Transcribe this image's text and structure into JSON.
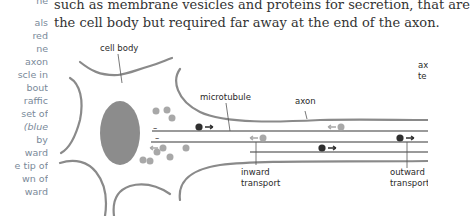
{
  "body_text": {
    "line1": "such as membrane vesicles and proteins for secretion, that are",
    "line2": "the cell body but required far away at the end of the axon."
  },
  "side_column": {
    "lines": [
      {
        "text": "ne",
        "italic": false
      },
      {
        "text": "als",
        "italic": false
      },
      {
        "text": "red",
        "italic": false
      },
      {
        "text": "ne",
        "italic": false
      },
      {
        "text": "axon",
        "italic": false
      },
      {
        "text": "scle in",
        "italic": false
      },
      {
        "text": "bout",
        "italic": false
      },
      {
        "text": "raffic",
        "italic": false
      },
      {
        "text": "set of",
        "italic": false
      },
      {
        "text": "(blue",
        "italic": true
      },
      {
        "text": "by",
        "italic": false
      },
      {
        "text": "ward",
        "italic": false
      },
      {
        "text": "e tip of",
        "italic": false
      },
      {
        "text": "wn of",
        "italic": false
      },
      {
        "text": "ward",
        "italic": false
      }
    ]
  },
  "diagram": {
    "labels": {
      "cell_body": "cell body",
      "microtubule": "microtubule",
      "axon": "axon",
      "axon_terminal_1": "ax",
      "axon_terminal_2": "te",
      "inward_1": "inward",
      "inward_2": "transport",
      "outward_1": "outward",
      "outward_2": "transport",
      "minus": "–"
    },
    "colors": {
      "membrane": "#8a8a8a",
      "nucleus": "#8c8c8c",
      "vesicle_inward": "#a8a8a8",
      "vesicle_outward": "#2f2f2f",
      "microtubule": "#9a9a9a"
    }
  }
}
